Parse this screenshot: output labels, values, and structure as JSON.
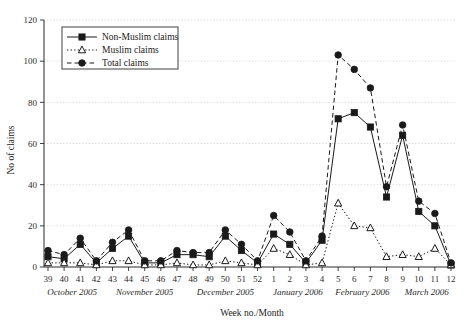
{
  "chart_data": {
    "type": "line",
    "title": "",
    "xlabel": "Week no./Month",
    "ylabel": "No of claims",
    "ylim": [
      0,
      120
    ],
    "yticks": [
      0,
      20,
      40,
      60,
      80,
      100,
      120
    ],
    "grid": true,
    "legend_position": "top-left",
    "categories": [
      "39",
      "40",
      "41",
      "42",
      "43",
      "44",
      "45",
      "46",
      "47",
      "48",
      "49",
      "50",
      "51",
      "52",
      "1",
      "2",
      "3",
      "4",
      "5",
      "6",
      "7",
      "8",
      "9",
      "10",
      "11",
      "12"
    ],
    "month_groups": [
      {
        "label": "October 2005",
        "weeks": [
          "39",
          "40",
          "41",
          "42"
        ]
      },
      {
        "label": "November 2005",
        "weeks": [
          "43",
          "44",
          "45",
          "46",
          "47"
        ]
      },
      {
        "label": "December 2005",
        "weeks": [
          "48",
          "49",
          "50",
          "51",
          "52"
        ]
      },
      {
        "label": "January 2006",
        "weeks": [
          "1",
          "2",
          "3",
          "4"
        ]
      },
      {
        "label": "February 2006",
        "weeks": [
          "5",
          "6",
          "7",
          "8"
        ]
      },
      {
        "label": "March 2006",
        "weeks": [
          "9",
          "10",
          "11",
          "12"
        ]
      }
    ],
    "series": [
      {
        "name": "Non-Muslim claims",
        "marker": "square",
        "line": "solid",
        "color": "#1a1a1a",
        "values": [
          5,
          4,
          11,
          2,
          9,
          15,
          2,
          2,
          6,
          6,
          5,
          15,
          8,
          2,
          16,
          11,
          2,
          13,
          72,
          75,
          68,
          34,
          64,
          27,
          20,
          1
        ]
      },
      {
        "name": "Muslim claims",
        "marker": "triangle",
        "line": "dotted",
        "color": "#1a1a1a",
        "values": [
          2,
          2,
          2,
          1,
          3,
          3,
          1,
          1,
          2,
          1,
          1,
          3,
          2,
          1,
          9,
          6,
          1,
          2,
          31,
          20,
          19,
          5,
          6,
          5,
          9,
          1
        ]
      },
      {
        "name": "Total claims",
        "marker": "circle",
        "line": "dashed",
        "color": "#1a1a1a",
        "values": [
          8,
          6,
          14,
          3,
          12,
          18,
          3,
          3,
          8,
          7,
          7,
          18,
          11,
          3,
          25,
          17,
          3,
          15,
          103,
          96,
          87,
          39,
          69,
          32,
          26,
          2
        ]
      }
    ]
  },
  "legend": {
    "items": [
      {
        "label": "Non-Muslim claims"
      },
      {
        "label": "Muslim claims"
      },
      {
        "label": "Total claims"
      }
    ]
  }
}
